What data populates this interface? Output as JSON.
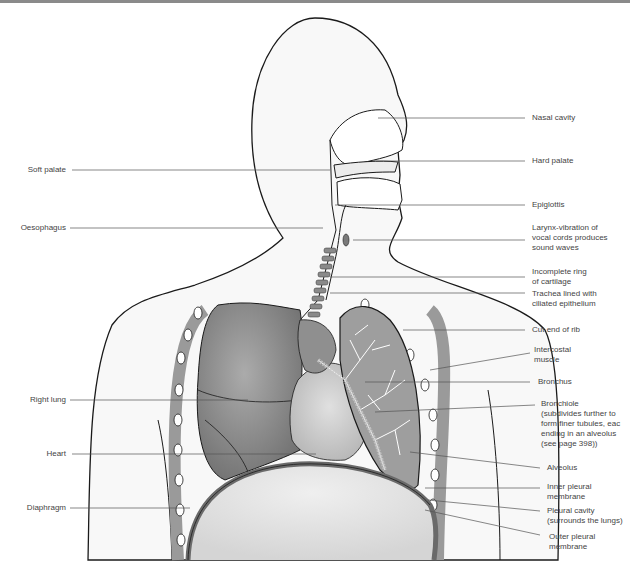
{
  "figure": {
    "colors": {
      "outline": "#1a1a1a",
      "lung_fill": "#8c8c8c",
      "lung_light": "#a8a8a8",
      "tissue_fill": "#d6d6d6",
      "body_fill": "#f7f7f7",
      "leader_line": "#555555",
      "label_text": "#444444"
    }
  },
  "labels_left": [
    {
      "id": "soft-palate",
      "text": "Soft palate"
    },
    {
      "id": "oesophagus",
      "text": "Oesophagus"
    },
    {
      "id": "right-lung",
      "text": "Right lung"
    },
    {
      "id": "heart",
      "text": "Heart"
    },
    {
      "id": "diaphragm",
      "text": "Diaphragm"
    }
  ],
  "labels_right": [
    {
      "id": "nasal-cavity",
      "lines": [
        "Nasal cavity"
      ]
    },
    {
      "id": "hard-palate",
      "lines": [
        "Hard palate"
      ]
    },
    {
      "id": "epiglottis",
      "lines": [
        "Epiglottis"
      ]
    },
    {
      "id": "larynx",
      "lines": [
        "Larynx-vibration of",
        "vocal cords produces",
        "sound waves"
      ]
    },
    {
      "id": "cartilage-ring",
      "lines": [
        "Incomplete ring",
        "of cartilage"
      ]
    },
    {
      "id": "trachea",
      "lines": [
        "Trachea lined with",
        "ciliated epithelium"
      ]
    },
    {
      "id": "cut-end-rib",
      "lines": [
        "Cut end of rib"
      ]
    },
    {
      "id": "intercostal-muscle",
      "lines": [
        "Intercostal",
        "muscle"
      ]
    },
    {
      "id": "bronchus",
      "lines": [
        "Bronchus"
      ]
    },
    {
      "id": "bronchiole",
      "lines": [
        "Bronchiole",
        "(subdivides further to",
        "form finer tubules, eac",
        "ending in an alveolus",
        "(see page 398))"
      ]
    },
    {
      "id": "alveolus",
      "lines": [
        "Alveolus"
      ]
    },
    {
      "id": "inner-pleural",
      "lines": [
        "Inner pleural",
        "membrane"
      ]
    },
    {
      "id": "pleural-cavity",
      "lines": [
        "Pleural cavity",
        "(surrounds the lungs)"
      ]
    },
    {
      "id": "outer-pleural",
      "lines": [
        "Outer pleural",
        "membrane"
      ]
    }
  ]
}
